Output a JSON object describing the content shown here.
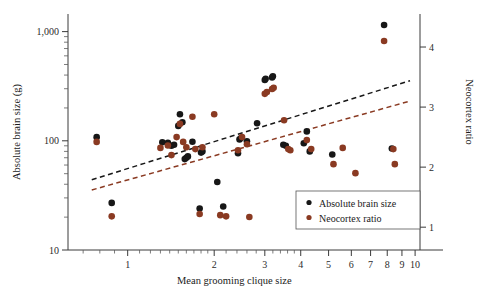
{
  "figure": {
    "background": "#ffffff",
    "axis_color": "#3a3a3a"
  },
  "chart_data": {
    "type": "scatter",
    "title": "",
    "xlabel": "Mean grooming clique size",
    "ylabel": "Absolute brain size (g)",
    "y2label": "Neocortex ratio",
    "xscale": "log",
    "yscale": "log",
    "y2scale": "linear",
    "xlim": [
      0.62,
      10.4
    ],
    "ylim": [
      10,
      1450
    ],
    "y2lim": [
      0.62,
      4.55
    ],
    "grid": false,
    "legend_position": "lower-right",
    "xticks": [
      1,
      2,
      3,
      4,
      5,
      6,
      7,
      8,
      9,
      10
    ],
    "xticklabels": [
      "1",
      "2",
      "3",
      "4",
      "5",
      "6",
      "7",
      "8",
      "9",
      "10"
    ],
    "yticks": [
      10,
      100,
      1000
    ],
    "yticklabels": [
      "10",
      "100",
      "1,000"
    ],
    "y2ticks": [
      1,
      2,
      3,
      4
    ],
    "y2ticklabels": [
      "1",
      "2",
      "3",
      "4"
    ],
    "series": [
      {
        "name": "Absolute brain size",
        "color": "#171717",
        "marker": "circle",
        "marker_size": 3.3,
        "axis": "left",
        "points": [
          [
            0.78,
            108
          ],
          [
            0.88,
            27
          ],
          [
            1.32,
            97
          ],
          [
            1.38,
            96
          ],
          [
            1.42,
            90
          ],
          [
            1.45,
            92
          ],
          [
            1.5,
            137
          ],
          [
            1.52,
            175
          ],
          [
            1.55,
            148
          ],
          [
            1.58,
            68
          ],
          [
            1.6,
            70
          ],
          [
            1.62,
            72
          ],
          [
            1.68,
            98
          ],
          [
            1.78,
            24
          ],
          [
            1.8,
            78
          ],
          [
            1.82,
            80
          ],
          [
            2.05,
            42
          ],
          [
            2.15,
            25
          ],
          [
            2.42,
            77
          ],
          [
            2.45,
            103
          ],
          [
            2.48,
            106
          ],
          [
            2.6,
            99
          ],
          [
            2.82,
            145
          ],
          [
            3.0,
            360
          ],
          [
            3.02,
            370
          ],
          [
            3.18,
            380
          ],
          [
            3.2,
            390
          ],
          [
            3.48,
            92
          ],
          [
            3.55,
            90
          ],
          [
            4.1,
            95
          ],
          [
            4.2,
            122
          ],
          [
            4.3,
            80
          ],
          [
            5.15,
            75
          ],
          [
            7.8,
            1150
          ],
          [
            8.3,
            85
          ]
        ]
      },
      {
        "name": "Neocortex ratio",
        "color": "#8a3a22",
        "marker": "circle",
        "marker_size": 3.3,
        "axis": "right",
        "points": [
          [
            0.78,
            2.42
          ],
          [
            0.88,
            1.18
          ],
          [
            1.3,
            2.32
          ],
          [
            1.38,
            2.36
          ],
          [
            1.42,
            2.2
          ],
          [
            1.48,
            2.5
          ],
          [
            1.52,
            2.72
          ],
          [
            1.56,
            2.42
          ],
          [
            1.6,
            2.33
          ],
          [
            1.68,
            2.84
          ],
          [
            1.72,
            2.3
          ],
          [
            1.78,
            1.22
          ],
          [
            1.82,
            2.33
          ],
          [
            2.0,
            2.88
          ],
          [
            2.1,
            1.2
          ],
          [
            2.2,
            1.18
          ],
          [
            2.42,
            2.28
          ],
          [
            2.5,
            2.5
          ],
          [
            2.6,
            2.38
          ],
          [
            2.65,
            1.17
          ],
          [
            3.0,
            3.22
          ],
          [
            3.05,
            3.25
          ],
          [
            3.18,
            3.3
          ],
          [
            3.22,
            3.32
          ],
          [
            3.5,
            2.78
          ],
          [
            3.62,
            2.3
          ],
          [
            3.68,
            2.28
          ],
          [
            4.2,
            2.45
          ],
          [
            4.35,
            2.3
          ],
          [
            5.2,
            2.05
          ],
          [
            5.6,
            2.32
          ],
          [
            6.2,
            1.9
          ],
          [
            7.8,
            4.1
          ],
          [
            8.5,
            2.05
          ],
          [
            8.4,
            2.3
          ]
        ]
      }
    ],
    "trendlines": [
      {
        "name": "Absolute brain size trend",
        "color": "#171717",
        "style": "dashed",
        "x_start": 0.75,
        "x_end": 9.6,
        "y_start_left_axis": 44,
        "y_end_left_axis": 355
      },
      {
        "name": "Neocortex ratio trend",
        "color": "#8a3a22",
        "style": "dashed",
        "x_start": 0.75,
        "x_end": 9.6,
        "y2_start": 1.62,
        "y2_end": 3.1
      }
    ]
  },
  "legend": {
    "items": [
      {
        "label": "Absolute brain size",
        "color": "#171717"
      },
      {
        "label": "Neocortex ratio",
        "color": "#8a3a22"
      }
    ]
  }
}
